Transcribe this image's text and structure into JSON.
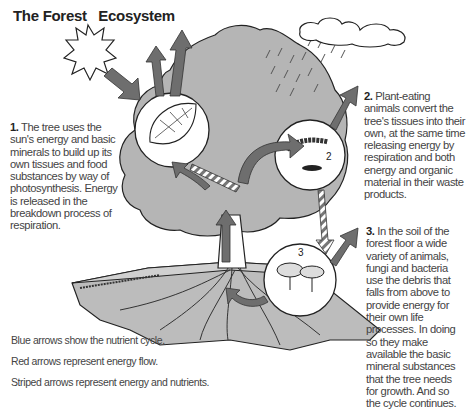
{
  "title": "The Forest   Ecosystem",
  "captions": [
    {
      "number": "1.",
      "text": " The tree uses the sun's energy and basic minerals to build up its own tissues and food substances by way of photosynthesis. Energy is released in the breakdown process of respiration."
    },
    {
      "number": "2.",
      "text": " Plant-eating animals convert the tree's tissues into their own, at the same time releasing energy by respiration and both energy and organic material in their waste products."
    },
    {
      "number": "3.",
      "text": " In the soil of the forest floor a wide variety of animals, fungi and bacteria use the debris that falls from above to provide energy for their own life processes. In doing so they make available the basic mineral substances that the tree needs for growth. And so the cycle continues."
    }
  ],
  "legend": [
    "Blue arrows show the nutrient cycle.",
    "Red arrows represent energy flow.",
    "Striped arrows represent energy and nutrients."
  ],
  "circle_labels": [
    "2",
    "3"
  ],
  "colors": {
    "canopy": "#b5b5b5",
    "soil": "#bcbcbc",
    "arrow": "#6e6e6e",
    "outline": "#222222"
  }
}
